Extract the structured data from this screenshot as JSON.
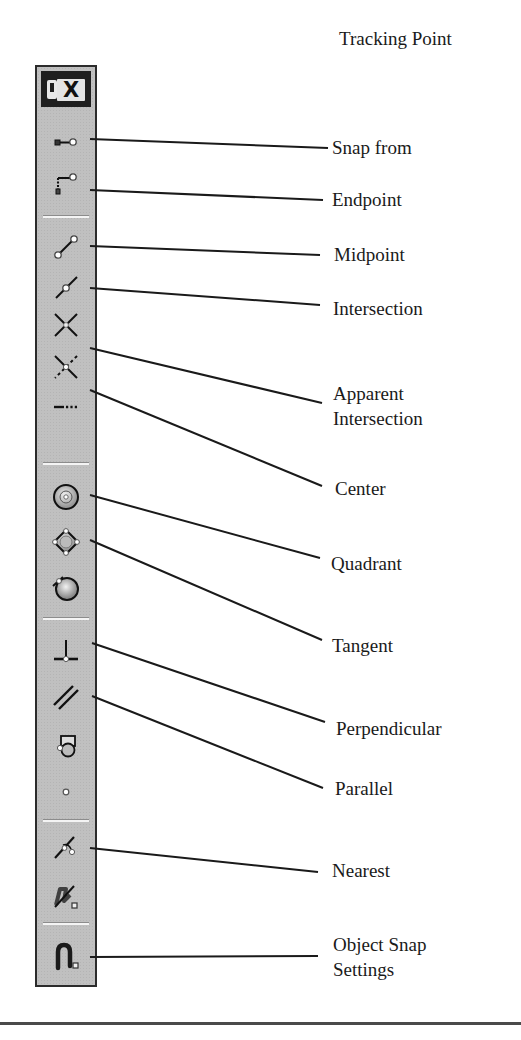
{
  "header": {
    "title": "Tracking Point"
  },
  "toolbar": {
    "close_label": "X",
    "tools": [
      {
        "id": "snap-from",
        "icon": "snap-from-icon",
        "label": "Snap from"
      },
      {
        "id": "endpoint",
        "icon": "endpoint-icon",
        "label": "Endpoint"
      },
      {
        "id": "midpoint",
        "icon": "midpoint-icon",
        "label": "Midpoint"
      },
      {
        "id": "intersection",
        "icon": "intersection-icon",
        "label": "Intersection"
      },
      {
        "id": "apparent-intersection",
        "icon": "apparent-intersection-icon",
        "label": "Apparent Intersection",
        "label_lines": [
          "Apparent",
          "Intersection"
        ]
      },
      {
        "id": "extension",
        "icon": "extension-icon",
        "label": ""
      },
      {
        "id": "center",
        "icon": "center-icon",
        "label": "Center"
      },
      {
        "id": "quadrant",
        "icon": "quadrant-icon",
        "label": "Quadrant"
      },
      {
        "id": "tangent",
        "icon": "tangent-icon",
        "label": "Tangent"
      },
      {
        "id": "perpendicular",
        "icon": "perpendicular-icon",
        "label": "Perpendicular"
      },
      {
        "id": "parallel",
        "icon": "parallel-icon",
        "label": "Parallel"
      },
      {
        "id": "insertion",
        "icon": "insertion-icon",
        "label": ""
      },
      {
        "id": "node",
        "icon": "node-icon",
        "label": ""
      },
      {
        "id": "nearest",
        "icon": "nearest-icon",
        "label": "Nearest"
      },
      {
        "id": "none",
        "icon": "snap-none-icon",
        "label": ""
      },
      {
        "id": "osnap-settings",
        "icon": "osnap-settings-icon",
        "label": "Object Snap Settings",
        "label_lines": [
          "Object Snap",
          "Settings"
        ]
      }
    ]
  },
  "callouts": {
    "snap_from": "Snap from",
    "endpoint": "Endpoint",
    "midpoint": "Midpoint",
    "intersection": "Intersection",
    "apparent_1": "Apparent",
    "apparent_2": "Intersection",
    "center": "Center",
    "quadrant": "Quadrant",
    "tangent": "Tangent",
    "perpendicular": "Perpendicular",
    "parallel": "Parallel",
    "nearest": "Nearest",
    "settings_1": "Object Snap",
    "settings_2": "Settings"
  },
  "colors": {
    "toolbar_bg": "#c0c0c0",
    "titlebar_bg": "#1f1f1f",
    "line": "#1a1a1a"
  }
}
